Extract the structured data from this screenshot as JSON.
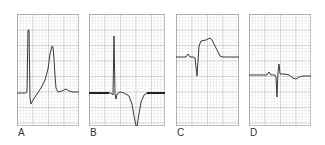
{
  "figure": {
    "panels": [
      {
        "id": "A",
        "label": "A",
        "description": "Tall R wave followed by large peaked (hyperacute) T wave"
      },
      {
        "id": "B",
        "label": "B",
        "description": "Tall R wave followed by deep inverted T wave"
      },
      {
        "id": "C",
        "label": "C",
        "description": "ST-segment elevation with tombstone morphology"
      },
      {
        "id": "D",
        "label": "D",
        "description": "Low-amplitude QRS with small inverted T wave"
      }
    ],
    "colors": {
      "grid_minor": "#c8c8c8",
      "grid_major": "#909090",
      "trace": "#3a3a3a",
      "label": "#333333"
    }
  }
}
